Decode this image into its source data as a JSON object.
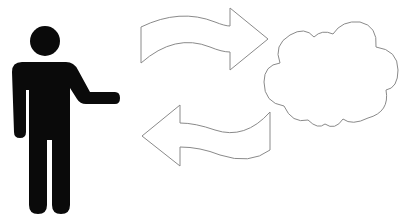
{
  "diagram": {
    "nodes": [
      {
        "id": "person",
        "icon": "person-icon",
        "fill": "#0a0a0a"
      },
      {
        "id": "cloud",
        "icon": "cloud-icon",
        "stroke": "#8a8a8a",
        "fill": "#ffffff"
      }
    ],
    "edges": [
      {
        "from": "person",
        "to": "cloud",
        "direction": "right",
        "icon": "arrow-right-icon"
      },
      {
        "from": "cloud",
        "to": "person",
        "direction": "left",
        "icon": "arrow-left-icon"
      }
    ],
    "colors": {
      "outline": "#8a8a8a",
      "person": "#0a0a0a",
      "background": "#ffffff"
    }
  }
}
